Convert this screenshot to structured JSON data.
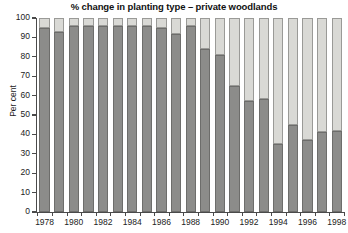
{
  "chart_data": {
    "type": "bar",
    "title": "% change in planting type – private woodlands",
    "xlabel": "",
    "ylabel": "Per cent",
    "ylim": [
      0,
      100
    ],
    "ytick_labels": [
      "100",
      "90",
      "80",
      "70",
      "60",
      "50",
      "40",
      "30",
      "20",
      "10",
      "0"
    ],
    "ytick_values": [
      100,
      90,
      80,
      70,
      60,
      50,
      40,
      30,
      20,
      10,
      0
    ],
    "grid": false,
    "legend": "none",
    "stacked": true,
    "categories": [
      "1978",
      "1979",
      "1980",
      "1981",
      "1982",
      "1983",
      "1984",
      "1985",
      "1986",
      "1987",
      "1988",
      "1989",
      "1990",
      "1991",
      "1992",
      "1993",
      "1994",
      "1995",
      "1996",
      "1997",
      "1998"
    ],
    "xtick_labels_shown": [
      "1978",
      "1980",
      "1982",
      "1984",
      "1986",
      "1988",
      "1990",
      "1992",
      "1994",
      "1996",
      "1998"
    ],
    "series": [
      {
        "name": "lower-segment",
        "color": "#8c8c8a",
        "values": [
          95,
          93,
          96,
          96,
          96,
          96,
          96,
          96,
          95,
          92,
          96,
          84,
          81,
          65,
          57,
          58,
          35,
          45,
          37,
          41,
          42
        ]
      },
      {
        "name": "upper-segment",
        "color": "#d9d9d5",
        "values": [
          5,
          7,
          4,
          4,
          4,
          4,
          4,
          4,
          5,
          8,
          4,
          16,
          19,
          35,
          43,
          42,
          65,
          55,
          63,
          59,
          58
        ]
      }
    ],
    "totals": [
      100,
      100,
      100,
      100,
      100,
      100,
      100,
      100,
      100,
      100,
      100,
      100,
      100,
      100,
      100,
      100,
      100,
      100,
      100,
      100,
      100
    ]
  },
  "colors": {
    "dark_segment": "#8c8c8a",
    "light_segment": "#d9d9d5",
    "axis": "#4a4a4a",
    "text": "#222222",
    "background": "#ffffff"
  }
}
